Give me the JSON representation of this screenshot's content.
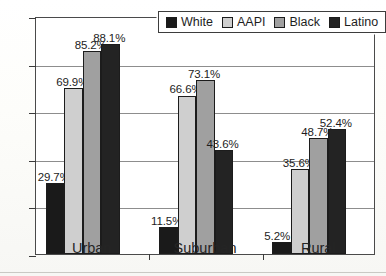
{
  "chart_data": {
    "type": "bar",
    "title": "",
    "xlabel": "",
    "ylabel": "",
    "ylim": [
      0,
      100
    ],
    "yticks": [
      0,
      20,
      40,
      60,
      80,
      100
    ],
    "grid": true,
    "legend_position": "top-right",
    "categories": [
      "Urban",
      "Suburban",
      "Rural"
    ],
    "series": [
      {
        "name": "White",
        "color": "#1a1a1a",
        "values": [
          29.7,
          11.5,
          5.2
        ],
        "labels": [
          "29.7%",
          "11.5%",
          "5.2%"
        ]
      },
      {
        "name": "AAPI",
        "color": "#cfcfcf",
        "values": [
          69.9,
          66.6,
          35.6
        ],
        "labels": [
          "69.9%",
          "66.6%",
          "35.6%"
        ]
      },
      {
        "name": "Black",
        "color": "#a0a0a0",
        "values": [
          85.2,
          73.1,
          48.7
        ],
        "labels": [
          "85.2%",
          "73.1%",
          "48.7%"
        ]
      },
      {
        "name": "Latino",
        "color": "#232323",
        "values": [
          88.1,
          43.6,
          52.4
        ],
        "labels": [
          "88.1%",
          "43.6%",
          "52.4%"
        ]
      }
    ]
  },
  "legend": {
    "items": [
      {
        "label": "White",
        "color": "#1a1a1a"
      },
      {
        "label": "AAPI",
        "color": "#cfcfcf"
      },
      {
        "label": "Black",
        "color": "#a0a0a0"
      },
      {
        "label": "Latino",
        "color": "#232323"
      }
    ]
  },
  "axes": {
    "y_tick_labels": [
      "100",
      "80",
      "60",
      "40",
      "20",
      "0"
    ],
    "x_tick_labels": [
      "Urban",
      "Suburban",
      "Rural"
    ]
  }
}
